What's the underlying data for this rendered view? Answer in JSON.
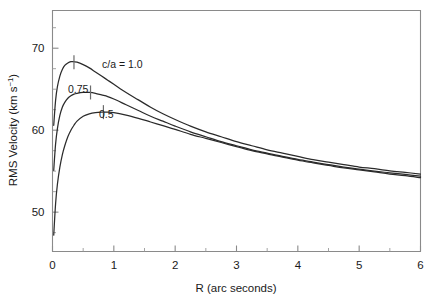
{
  "figure": {
    "background": "#ffffff",
    "ink_color": "#2b2b2b",
    "axis_color": "#8a8a8a"
  },
  "axes": {
    "x_title": "R (arc seconds)",
    "y_title_main": "RMS Velocity (km s",
    "y_title_exp": "−1",
    "y_title_close": ")",
    "x_ticklabels": [
      "0",
      "1",
      "2",
      "3",
      "4",
      "5",
      "6"
    ],
    "y_ticklabels": [
      "50",
      "60",
      "70"
    ]
  },
  "curve_labels": {
    "top": "c/a = 1.0",
    "middle": "0.75",
    "bottom": "0.5"
  },
  "chart_data": {
    "type": "line",
    "title": "",
    "xlabel": "R (arc seconds)",
    "ylabel": "RMS Velocity (km s^-1)",
    "xlim": [
      0,
      6
    ],
    "ylim": [
      45.2,
      74.6
    ],
    "xticks": [
      0,
      1,
      2,
      3,
      4,
      5,
      6
    ],
    "xticks_minor": [
      0.5,
      1.5,
      2.5,
      3.5,
      4.5,
      5.5
    ],
    "yticks": [
      50,
      60,
      70
    ],
    "yticks_minor": [
      47.5,
      52.5,
      55,
      57.5,
      62.5,
      65,
      67.5,
      72.5
    ],
    "grid": false,
    "legend": "inline-annotations",
    "series": [
      {
        "name": "c/a = 1.0",
        "label": "c/a = 1.0",
        "peak_marker": {
          "x": 0.35,
          "y": 68.3
        },
        "x": [
          0.02,
          0.05,
          0.08,
          0.12,
          0.16,
          0.2,
          0.25,
          0.3,
          0.35,
          0.4,
          0.5,
          0.6,
          0.7,
          0.8,
          0.9,
          1.0,
          1.2,
          1.4,
          1.6,
          1.8,
          2.0,
          2.25,
          2.5,
          2.75,
          3.0,
          3.25,
          3.5,
          3.75,
          4.0,
          4.25,
          4.5,
          4.75,
          5.0,
          5.25,
          5.5,
          5.75,
          6.0
        ],
        "y": [
          60.6,
          63.6,
          65.3,
          66.6,
          67.4,
          67.9,
          68.2,
          68.35,
          68.35,
          68.3,
          68.0,
          67.6,
          67.1,
          66.6,
          66.1,
          65.6,
          64.6,
          63.7,
          62.8,
          62.0,
          61.3,
          60.5,
          59.8,
          59.2,
          58.6,
          58.1,
          57.6,
          57.2,
          56.8,
          56.4,
          56.1,
          55.8,
          55.5,
          55.3,
          55.05,
          54.85,
          54.65
        ]
      },
      {
        "name": "c/a = 0.75",
        "label": "0.75",
        "peak_marker": {
          "x": 0.62,
          "y": 64.6
        },
        "x": [
          0.02,
          0.05,
          0.08,
          0.12,
          0.16,
          0.2,
          0.25,
          0.3,
          0.35,
          0.4,
          0.5,
          0.6,
          0.7,
          0.8,
          0.9,
          1.0,
          1.2,
          1.4,
          1.6,
          1.8,
          2.0,
          2.25,
          2.5,
          2.75,
          3.0,
          3.25,
          3.5,
          3.75,
          4.0,
          4.25,
          4.5,
          4.75,
          5.0,
          5.25,
          5.5,
          5.75,
          6.0
        ],
        "y": [
          55.1,
          58.3,
          60.2,
          61.8,
          62.8,
          63.4,
          63.9,
          64.2,
          64.4,
          64.5,
          64.6,
          64.6,
          64.5,
          64.3,
          64.1,
          63.8,
          63.1,
          62.4,
          61.7,
          61.1,
          60.5,
          59.8,
          59.2,
          58.6,
          58.1,
          57.6,
          57.2,
          56.8,
          56.45,
          56.1,
          55.8,
          55.5,
          55.25,
          55.0,
          54.8,
          54.6,
          54.4
        ]
      },
      {
        "name": "c/a = 0.5",
        "label": "0.5",
        "peak_marker": {
          "x": 0.83,
          "y": 62.2
        },
        "x": [
          0.02,
          0.05,
          0.08,
          0.12,
          0.16,
          0.2,
          0.25,
          0.3,
          0.35,
          0.4,
          0.5,
          0.6,
          0.7,
          0.8,
          0.9,
          1.0,
          1.2,
          1.4,
          1.6,
          1.8,
          2.0,
          2.25,
          2.5,
          2.75,
          3.0,
          3.25,
          3.5,
          3.75,
          4.0,
          4.25,
          4.5,
          4.75,
          5.0,
          5.25,
          5.5,
          5.75,
          6.0
        ],
        "y": [
          47.2,
          51.0,
          53.4,
          55.5,
          57.0,
          58.1,
          59.2,
          60.0,
          60.6,
          61.1,
          61.7,
          62.0,
          62.15,
          62.2,
          62.2,
          62.15,
          61.85,
          61.45,
          61.0,
          60.55,
          60.1,
          59.5,
          59.0,
          58.5,
          58.0,
          57.5,
          57.1,
          56.7,
          56.35,
          56.0,
          55.7,
          55.4,
          55.15,
          54.9,
          54.65,
          54.45,
          54.2
        ]
      }
    ]
  }
}
